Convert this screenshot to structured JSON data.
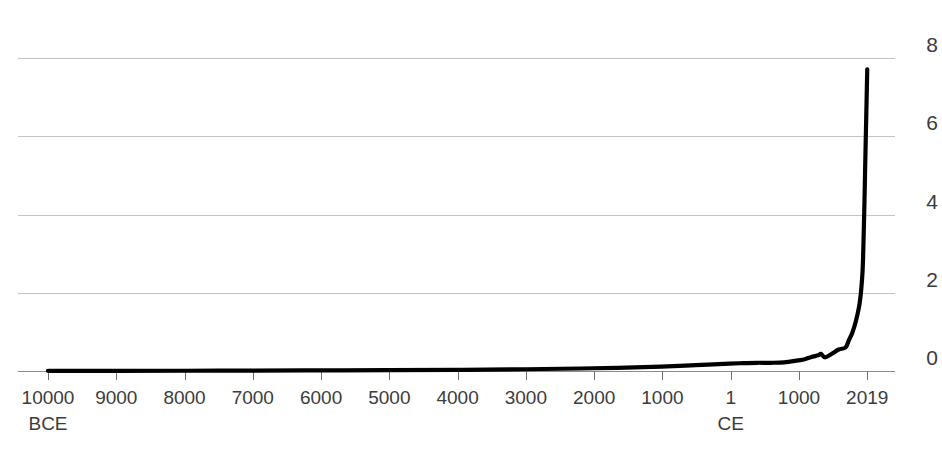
{
  "chart_data": {
    "type": "line",
    "title": "",
    "subtitle": "",
    "xlabel": "",
    "ylabel": "",
    "grid": true,
    "legend": null,
    "y_axis": {
      "ticks": [
        0,
        2,
        4,
        6,
        8
      ],
      "tick_labels": [
        "0",
        "2",
        "4",
        "6",
        "8"
      ],
      "ylim": [
        0,
        8
      ],
      "unit": "billions of people",
      "label_side": "right"
    },
    "x_axis": {
      "tick_labels": [
        "10000",
        "9000",
        "8000",
        "7000",
        "6000",
        "5000",
        "4000",
        "3000",
        "2000",
        "1000",
        "1",
        "1000",
        "2019"
      ],
      "era_labels": [
        {
          "at_tick_index": 0,
          "text": "BCE"
        },
        {
          "at_tick_index": 10,
          "text": "CE"
        }
      ],
      "xlim_years": [
        -10000,
        2019
      ],
      "scale": "linear"
    },
    "series": [
      {
        "name": "World population",
        "color": "#000000",
        "x": [
          -10000,
          -9000,
          -8000,
          -7000,
          -6000,
          -5000,
          -4000,
          -3000,
          -2000,
          -1000,
          -500,
          1,
          200,
          400,
          600,
          800,
          1000,
          1100,
          1200,
          1300,
          1340,
          1400,
          1500,
          1600,
          1700,
          1750,
          1800,
          1850,
          1900,
          1930,
          1950,
          1960,
          1970,
          1980,
          1990,
          2000,
          2010,
          2019
        ],
        "values": [
          0.004,
          0.005,
          0.007,
          0.01,
          0.015,
          0.02,
          0.03,
          0.045,
          0.07,
          0.11,
          0.15,
          0.19,
          0.2,
          0.21,
          0.21,
          0.22,
          0.27,
          0.3,
          0.36,
          0.4,
          0.44,
          0.35,
          0.44,
          0.55,
          0.6,
          0.79,
          0.98,
          1.26,
          1.65,
          2.07,
          2.54,
          3.03,
          3.7,
          4.46,
          5.33,
          6.14,
          6.96,
          7.71
        ]
      }
    ],
    "annotations": [
      {
        "text": "plateau near 1300-1400 (plague decline)",
        "visible_on_chart": false
      }
    ]
  }
}
